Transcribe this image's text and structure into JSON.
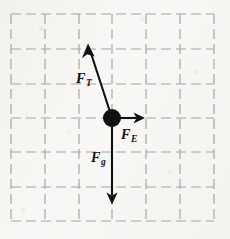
{
  "figure": {
    "background_color": "#f8f7f5",
    "ink_color": "#111111",
    "grid_color": "#9d9d9d"
  },
  "grid": {
    "style": "dashed",
    "dash_length_px": 10,
    "dash_gap_px": 5,
    "columns": 6,
    "rows": 6,
    "vertical_lines_x": [
      11,
      45,
      79,
      112,
      146,
      180,
      214
    ],
    "horizontal_lines_y": [
      14,
      49,
      84,
      118,
      152,
      187,
      221
    ],
    "cell_size_px": 34
  },
  "particle": {
    "name": "charged-bob",
    "center_x": 112,
    "center_y": 118,
    "radius_px": 9,
    "fill": "#111111"
  },
  "vectors": [
    {
      "id": "tension",
      "symbol": "F",
      "subscript": "T",
      "label_text": "F_T",
      "from_x": 112,
      "from_y": 118,
      "to_x": 88,
      "to_y": 44,
      "direction": "up-left",
      "label_x": 76,
      "label_y": 72
    },
    {
      "id": "electric",
      "symbol": "F",
      "subscript": "E",
      "label_text": "F_E",
      "from_x": 112,
      "from_y": 118,
      "to_x": 144,
      "to_y": 118,
      "direction": "right",
      "label_x": 121,
      "label_y": 128
    },
    {
      "id": "gravity",
      "symbol": "F",
      "subscript": "g",
      "label_text": "F_g",
      "from_x": 112,
      "from_y": 118,
      "to_x": 112,
      "to_y": 204,
      "direction": "down",
      "label_x": 91,
      "label_y": 151
    }
  ],
  "labels": {
    "tension_symbol": "F",
    "tension_subscript": "T",
    "electric_symbol": "F",
    "electric_subscript": "E",
    "gravity_symbol": "F",
    "gravity_subscript": "g"
  }
}
